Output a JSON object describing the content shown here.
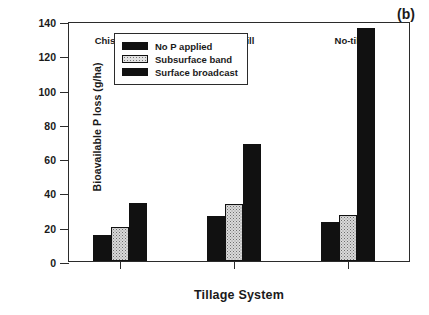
{
  "chart_data": {
    "type": "bar",
    "title": "",
    "panel_label": "(b)",
    "xlabel": "Tillage System",
    "ylabel": "Bioavailable P loss (g/ha)",
    "categories": [
      "Chisel-disk",
      "Ridge-till",
      "No-till"
    ],
    "series": [
      {
        "name": "No P applied",
        "values": [
          15,
          26,
          23
        ]
      },
      {
        "name": "Subsurface band",
        "values": [
          20,
          33,
          27
        ]
      },
      {
        "name": "Surface broadcast",
        "values": [
          34,
          68,
          136
        ]
      }
    ],
    "ylim": [
      0,
      140
    ],
    "yticks": [
      0,
      20,
      40,
      60,
      80,
      100,
      120,
      140
    ],
    "grid": false,
    "legend_position": "upper-left",
    "colors": {
      "series_0": "#111111",
      "series_1": "#d9d9d9",
      "series_2": "#111111",
      "axis": "#2b2b2b",
      "background": "#ffffff"
    }
  }
}
